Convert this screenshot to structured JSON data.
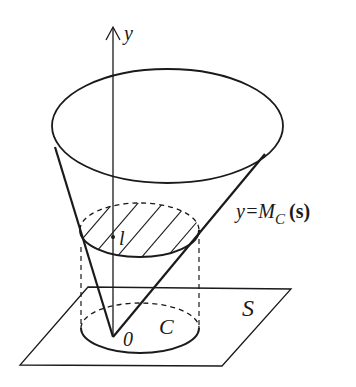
{
  "diagram": {
    "type": "3d-geometric-figure",
    "labels": {
      "axis": "y",
      "surface_eq_prefix": "y=M",
      "surface_eq_sub": "C",
      "surface_eq_arg": "(s)",
      "level": "l",
      "origin": "0",
      "set": "C",
      "plane": "S"
    },
    "colors": {
      "stroke": "#1a1a1a",
      "background": "#ffffff"
    }
  }
}
